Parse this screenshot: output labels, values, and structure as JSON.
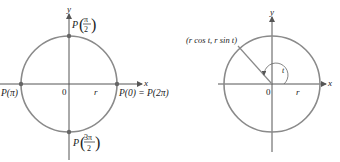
{
  "left_diagram": {
    "axes": {
      "x_label": "x",
      "y_label": "y",
      "origin_label": "0",
      "radius_label": "r"
    },
    "points": {
      "top": {
        "label_prefix": "P",
        "num": "π",
        "den": "2"
      },
      "left": {
        "label": "P(π)"
      },
      "right": {
        "label": "P(0) = P(2π)"
      },
      "bottom": {
        "label_prefix": "P",
        "num": "3π",
        "den": "2"
      }
    }
  },
  "right_diagram": {
    "axes": {
      "x_label": "x",
      "y_label": "y",
      "origin_label": "0",
      "radius_label": "r"
    },
    "point_label": "(r cos t, r sin t)",
    "angle_label": "t"
  },
  "colors": {
    "circle": "#8a8a8a",
    "axis": "#555555",
    "text": "#222222"
  }
}
